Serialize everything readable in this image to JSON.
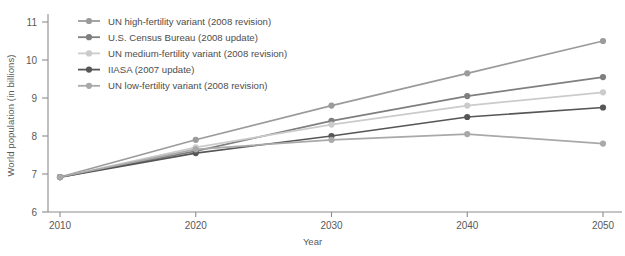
{
  "chart_data": {
    "type": "line",
    "title": "",
    "subtitle": "",
    "xlabel": "Year",
    "ylabel": "World population (in billions)",
    "x": [
      2010,
      2020,
      2030,
      2040,
      2050
    ],
    "xtick_labels": [
      "2010",
      "2020",
      "2030",
      "2040",
      "2050"
    ],
    "ytick_labels": [
      "6",
      "7",
      "8",
      "9",
      "10",
      "11"
    ],
    "yticks": [
      6,
      7,
      8,
      9,
      10,
      11
    ],
    "xlim": [
      2010,
      2050
    ],
    "ylim": [
      6,
      11
    ],
    "grid": false,
    "legend_position": "top-left-inside",
    "markers": true,
    "series": [
      {
        "name": "UN high-fertility variant (2008 revision)",
        "color": "#9b9b9b",
        "values": [
          6.92,
          7.9,
          8.8,
          9.65,
          10.5
        ]
      },
      {
        "name": "U.S. Census Bureau (2008 update)",
        "color": "#7f7f7f",
        "values": [
          6.92,
          7.6,
          8.4,
          9.05,
          9.55
        ]
      },
      {
        "name": "UN medium-fertility variant (2008 revision)",
        "color": "#cbcbcb",
        "values": [
          6.92,
          7.7,
          8.3,
          8.8,
          9.15
        ]
      },
      {
        "name": "IIASA (2007 update)",
        "color": "#565656",
        "values": [
          6.92,
          7.55,
          8.0,
          8.5,
          8.75
        ]
      },
      {
        "name": "UN low-fertility variant (2008 revision)",
        "color": "#a9a9a9",
        "values": [
          6.92,
          7.65,
          7.9,
          8.05,
          7.8
        ]
      }
    ]
  },
  "axis": {
    "y_title": "World population (in billions)",
    "x_title": "Year"
  },
  "colors": {
    "axis": "#8c8c8c",
    "tick_text": "#595959",
    "legend_text": "#4d4d4d",
    "background": "#ffffff"
  }
}
